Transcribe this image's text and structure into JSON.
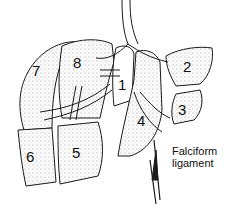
{
  "figure": {
    "segments": [
      {
        "id": "7",
        "label": "7"
      },
      {
        "id": "8",
        "label": "8"
      },
      {
        "id": "1",
        "label": "1"
      },
      {
        "id": "2",
        "label": "2"
      },
      {
        "id": "3",
        "label": "3"
      },
      {
        "id": "4",
        "label": "4"
      },
      {
        "id": "5",
        "label": "5"
      },
      {
        "id": "6",
        "label": "6"
      }
    ],
    "annotations": {
      "falciform_line1": "Falciform",
      "falciform_line2": "ligament"
    },
    "colors": {
      "stroke": "#1a1a1a",
      "stipple": "#d9d9d9",
      "background": "#ffffff"
    }
  }
}
